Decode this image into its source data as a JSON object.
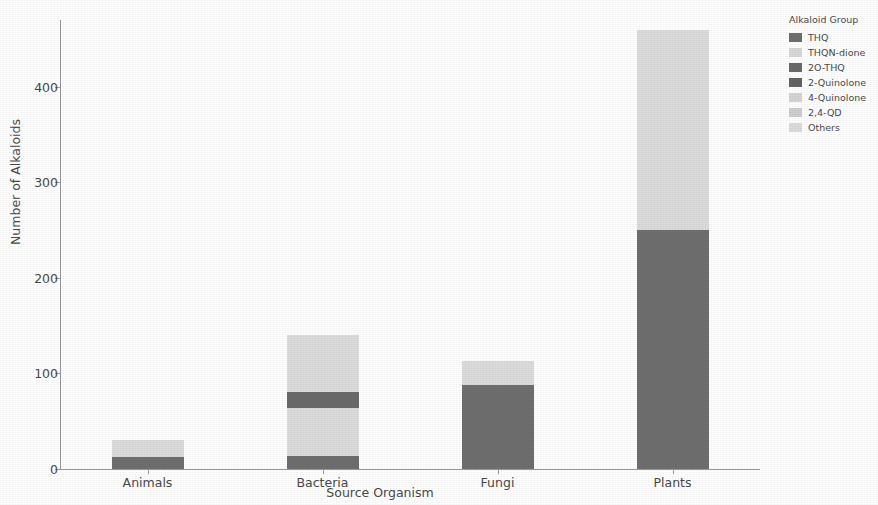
{
  "chart_data": {
    "type": "bar",
    "stacked": true,
    "title": "",
    "xlabel": "Source Organism",
    "ylabel": "Number of Alkaloids",
    "categories": [
      "Animals",
      "Bacteria",
      "Fungi",
      "Plants"
    ],
    "ylim": [
      0,
      470
    ],
    "yticks": [
      0,
      100,
      200,
      300,
      400
    ],
    "ytick_labels": [
      "0",
      "100",
      "200",
      "300",
      "400"
    ],
    "grid": false,
    "legend_position": "right-outside",
    "legend_title": "Alkaloid Group",
    "series": [
      {
        "name": "THQ",
        "color": "#6f6f6f",
        "values": [
          13,
          14,
          88,
          250
        ]
      },
      {
        "name": "THQN-dione",
        "color": "#d8d8d8",
        "values": [
          0,
          0,
          0,
          0
        ]
      },
      {
        "name": "2O-THQ",
        "color": "#6a6a6a",
        "values": [
          0,
          17,
          0,
          0
        ]
      },
      {
        "name": "2-Quinolone",
        "color": "#636363",
        "values": [
          0,
          0,
          0,
          0
        ]
      },
      {
        "name": "4-Quinolone",
        "color": "#d5d5d5",
        "values": [
          0,
          0,
          0,
          0
        ]
      },
      {
        "name": "2,4-QD",
        "color": "#cfcfcf",
        "values": [
          0,
          0,
          0,
          0
        ]
      },
      {
        "name": "Others",
        "color": "#dcdcdc",
        "values": [
          17,
          109,
          25,
          210
        ]
      }
    ],
    "totals": [
      30,
      140,
      113,
      460
    ]
  },
  "axis": {
    "y_title": "Number of Alkaloids",
    "x_title": "Source Organism"
  },
  "legend": {
    "title": "Alkaloid Group",
    "items": [
      {
        "label": "THQ",
        "color": "#6f6f6f"
      },
      {
        "label": "THQN-dione",
        "color": "#d8d8d8"
      },
      {
        "label": "2O-THQ",
        "color": "#6a6a6a"
      },
      {
        "label": "2-Quinolone",
        "color": "#636363"
      },
      {
        "label": "4-Quinolone",
        "color": "#d5d5d5"
      },
      {
        "label": "2,4-QD",
        "color": "#cfcfcf"
      },
      {
        "label": "Others",
        "color": "#dcdcdc"
      }
    ]
  },
  "style": {
    "axis_color": "#9a9a9a",
    "text_color": "#4a4a4a",
    "background": "#ffffff"
  }
}
